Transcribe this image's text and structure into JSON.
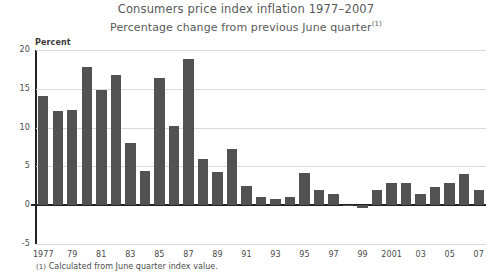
{
  "chart_data": {
    "type": "bar",
    "title": "Consumers price index inflation 1977–2007",
    "subtitle": "Percentage change from previous June quarter",
    "subtitle_marker": "(1)",
    "footnote": "Calculated from June quarter index value.",
    "footnote_marker": "(1)",
    "ylabel": "Percent",
    "xlabel": "",
    "ylim": [
      -5,
      20
    ],
    "yticks": [
      20,
      15,
      10,
      5,
      0,
      -5
    ],
    "ytick_labels": [
      "20",
      "15",
      "10",
      "5",
      "0",
      "-5"
    ],
    "grid": true,
    "legend": "none",
    "bar_color": "#525252",
    "axis_color": "#222222",
    "grid_color": "#d9d9d9",
    "title_color": "#58595b",
    "x": [
      1977,
      1978,
      1979,
      1980,
      1981,
      1982,
      1983,
      1984,
      1985,
      1986,
      1987,
      1988,
      1989,
      1990,
      1991,
      1992,
      1993,
      1994,
      1995,
      1996,
      1997,
      1998,
      1999,
      2000,
      2001,
      2002,
      2003,
      2004,
      2005,
      2006,
      2007
    ],
    "categories": [
      "1977",
      "1978",
      "1979",
      "1980",
      "1981",
      "1982",
      "1983",
      "1984",
      "1985",
      "1986",
      "1987",
      "1988",
      "1989",
      "1990",
      "1991",
      "1992",
      "1993",
      "1994",
      "1995",
      "1996",
      "1997",
      "1998",
      "1999",
      "2000",
      "2001",
      "2002",
      "2003",
      "2004",
      "2005",
      "2006",
      "2007"
    ],
    "xtick_labels": [
      "1977",
      "79",
      "81",
      "83",
      "85",
      "87",
      "89",
      "91",
      "93",
      "95",
      "97",
      "99",
      "2001",
      "03",
      "05",
      "07"
    ],
    "xtick_years": [
      1977,
      1979,
      1981,
      1983,
      1985,
      1987,
      1989,
      1991,
      1993,
      1995,
      1997,
      1999,
      2001,
      2003,
      2005,
      2007
    ],
    "values": [
      14.1,
      12.2,
      12.3,
      17.8,
      14.9,
      16.8,
      8.0,
      4.4,
      16.4,
      10.2,
      18.8,
      6.0,
      4.3,
      7.3,
      2.5,
      1.0,
      0.8,
      1.1,
      4.2,
      2.0,
      1.4,
      0.0,
      -0.4,
      2.0,
      2.9,
      2.8,
      1.5,
      2.4,
      2.8,
      4.0,
      2.0
    ],
    "ylabel_unit": "Percent"
  }
}
